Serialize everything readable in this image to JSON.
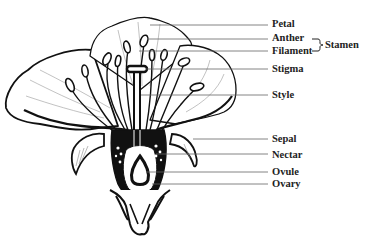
{
  "diagram": {
    "labels": [
      {
        "id": "petal",
        "text": "Petal",
        "x": 272,
        "y": 19
      },
      {
        "id": "anther",
        "text": "Anther",
        "x": 272,
        "y": 33
      },
      {
        "id": "filament",
        "text": "Filament",
        "x": 272,
        "y": 46
      },
      {
        "id": "stigma",
        "text": "Stigma",
        "x": 272,
        "y": 66
      },
      {
        "id": "style",
        "text": "Style",
        "x": 272,
        "y": 92
      },
      {
        "id": "sepal",
        "text": "Sepal",
        "x": 272,
        "y": 138
      },
      {
        "id": "nectar",
        "text": "Nectar",
        "x": 272,
        "y": 154
      },
      {
        "id": "ovule",
        "text": "Ovule",
        "x": 272,
        "y": 170
      },
      {
        "id": "ovary",
        "text": "Ovary",
        "x": 272,
        "y": 182
      }
    ],
    "group_label": {
      "text": "Stamen",
      "x": 329,
      "y": 39
    },
    "leader_lines": [
      {
        "for": "petal",
        "x1": 150,
        "y1": 25,
        "x2": 268,
        "y2": 25
      },
      {
        "for": "anther",
        "x1": 147,
        "y1": 39,
        "x2": 268,
        "y2": 39
      },
      {
        "for": "filament",
        "x1": 139,
        "y1": 51,
        "x2": 268,
        "y2": 51
      },
      {
        "for": "stigma",
        "x1": 146,
        "y1": 69,
        "x2": 268,
        "y2": 69
      },
      {
        "for": "style",
        "x1": 141,
        "y1": 95,
        "x2": 268,
        "y2": 95
      },
      {
        "for": "sepal",
        "x1": 193,
        "y1": 139,
        "x2": 268,
        "y2": 139
      },
      {
        "for": "nectar",
        "x1": 156,
        "y1": 154,
        "x2": 268,
        "y2": 154
      },
      {
        "for": "ovule",
        "x1": 146,
        "y1": 172,
        "x2": 268,
        "y2": 172
      },
      {
        "for": "ovary",
        "x1": 152,
        "y1": 184,
        "x2": 268,
        "y2": 184
      }
    ],
    "colors": {
      "ink": "#111111",
      "leader": "#666666",
      "text": "#222222",
      "background": "#ffffff"
    }
  }
}
